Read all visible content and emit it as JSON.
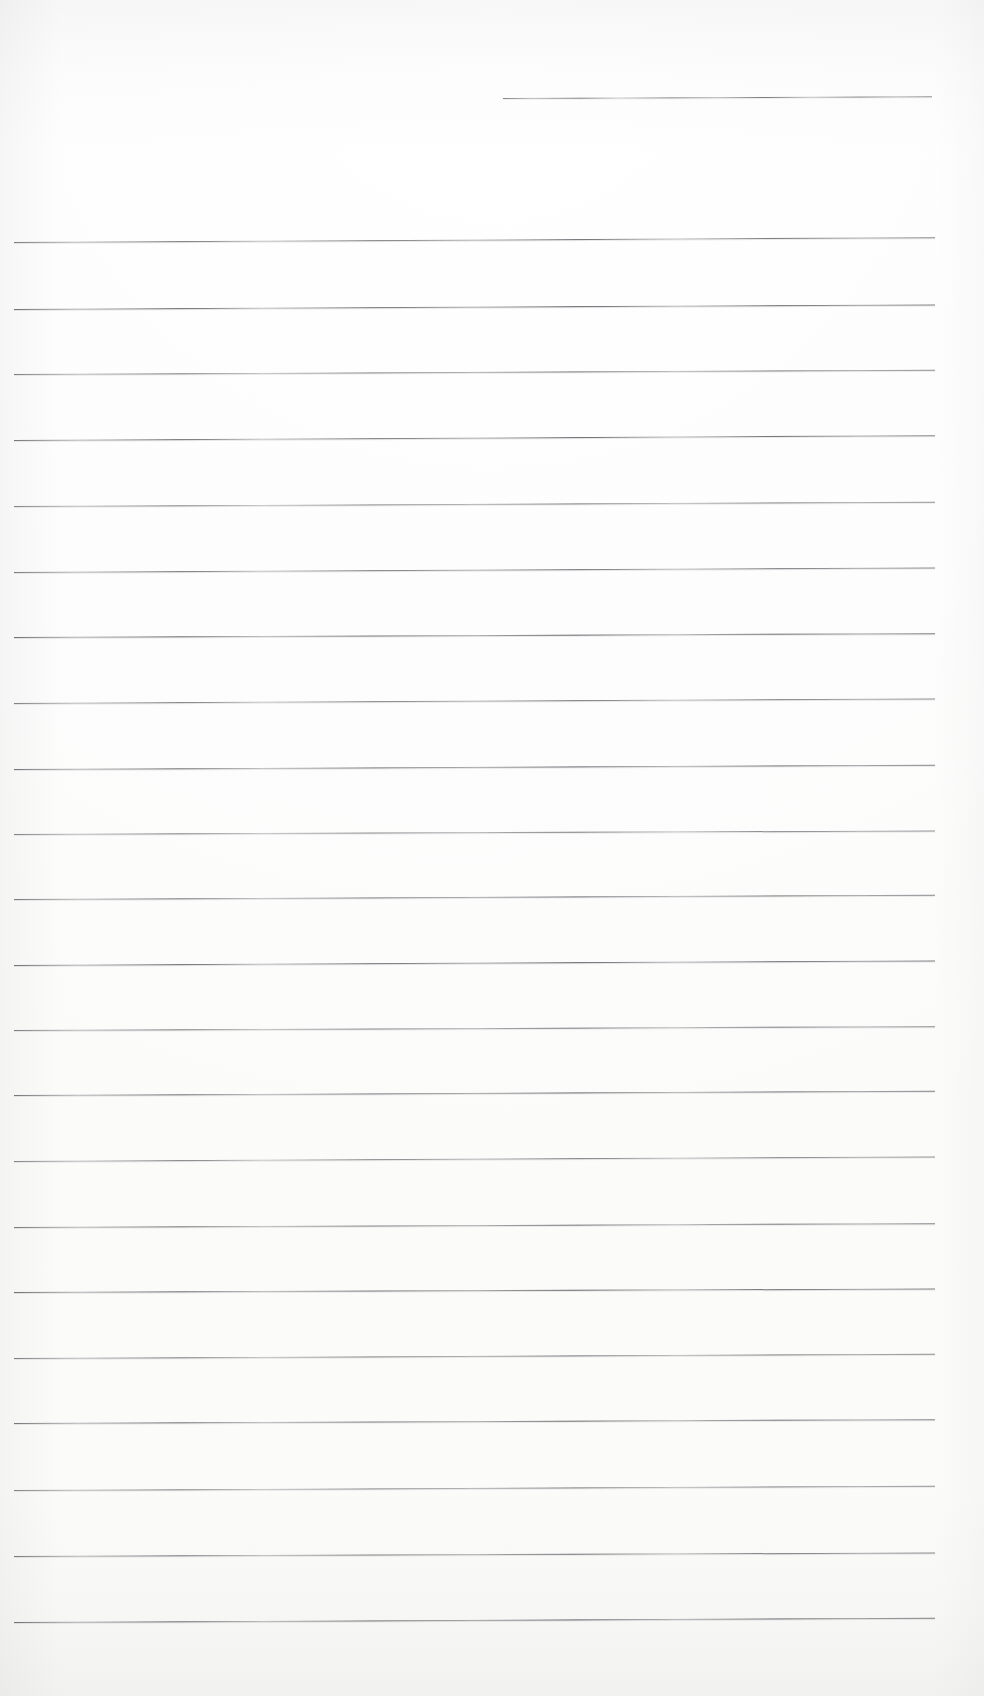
{
  "document": {
    "kind": "scanned-blank-ruled-notebook-page",
    "page_width": 984,
    "page_height": 1696,
    "background_color": "#fefefe",
    "rule_color": "#5f5f64",
    "has_visible_text": false,
    "has_margin_line": false,
    "body_text": "",
    "header_text": "",
    "footer_text": "",
    "page_number": ""
  },
  "ruling": {
    "full_line_left_x": 14,
    "full_line_right_x": 935,
    "line_spacing_px": 65.7,
    "line_thickness_px": 1,
    "full_line_count": 22,
    "short_line_count": 1,
    "short_line": {
      "left_x": 503,
      "right_x": 932,
      "y": 98,
      "tilt_deg": -0.22
    },
    "lines": [
      {
        "y": 98,
        "x": 503,
        "width": 429,
        "tilt": -0.22,
        "short": true
      },
      {
        "y": 242,
        "x": 14,
        "width": 921,
        "tilt": -0.3,
        "short": false
      },
      {
        "y": 309,
        "x": 14,
        "width": 921,
        "tilt": -0.28,
        "short": false
      },
      {
        "y": 374,
        "x": 14,
        "width": 921,
        "tilt": -0.26,
        "short": false
      },
      {
        "y": 440,
        "x": 14,
        "width": 921,
        "tilt": -0.3,
        "short": false
      },
      {
        "y": 506,
        "x": 14,
        "width": 921,
        "tilt": -0.26,
        "short": false
      },
      {
        "y": 572,
        "x": 14,
        "width": 921,
        "tilt": -0.28,
        "short": false
      },
      {
        "y": 637,
        "x": 14,
        "width": 921,
        "tilt": -0.24,
        "short": false
      },
      {
        "y": 703,
        "x": 14,
        "width": 921,
        "tilt": -0.28,
        "short": false
      },
      {
        "y": 769,
        "x": 14,
        "width": 921,
        "tilt": -0.26,
        "short": false
      },
      {
        "y": 834,
        "x": 14,
        "width": 921,
        "tilt": -0.22,
        "short": false
      },
      {
        "y": 899,
        "x": 14,
        "width": 921,
        "tilt": -0.26,
        "short": false
      },
      {
        "y": 965,
        "x": 14,
        "width": 921,
        "tilt": -0.28,
        "short": false
      },
      {
        "y": 1030,
        "x": 14,
        "width": 921,
        "tilt": -0.24,
        "short": false
      },
      {
        "y": 1095,
        "x": 14,
        "width": 921,
        "tilt": -0.26,
        "short": false
      },
      {
        "y": 1161,
        "x": 14,
        "width": 921,
        "tilt": -0.28,
        "short": false
      },
      {
        "y": 1227,
        "x": 14,
        "width": 921,
        "tilt": -0.24,
        "short": false
      },
      {
        "y": 1292,
        "x": 14,
        "width": 921,
        "tilt": -0.22,
        "short": false
      },
      {
        "y": 1358,
        "x": 14,
        "width": 921,
        "tilt": -0.26,
        "short": false
      },
      {
        "y": 1423,
        "x": 14,
        "width": 921,
        "tilt": -0.24,
        "short": false
      },
      {
        "y": 1490,
        "x": 14,
        "width": 921,
        "tilt": -0.26,
        "short": false
      },
      {
        "y": 1556,
        "x": 14,
        "width": 921,
        "tilt": -0.22,
        "short": false
      },
      {
        "y": 1622,
        "x": 14,
        "width": 921,
        "tilt": -0.26,
        "short": false
      }
    ]
  }
}
